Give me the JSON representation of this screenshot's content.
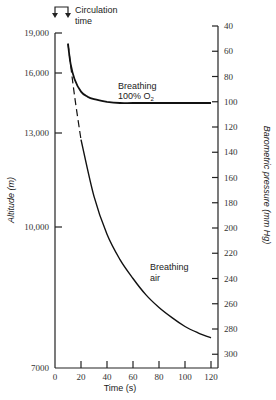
{
  "chart_data": {
    "type": "line",
    "title": "",
    "xlabel": "Time (s)",
    "ylabel_left": "Altitude (m)",
    "ylabel_right": "Barometric pressure (mm Hg)",
    "x_ticks": [
      "0",
      "20",
      "40",
      "60",
      "80",
      "100",
      "120"
    ],
    "xlim": [
      0,
      125
    ],
    "y_left_ticks": [
      "19,000",
      "16,000",
      "13,000",
      "10,000",
      "7000"
    ],
    "y_right_ticks": [
      "40",
      "60",
      "80",
      "100",
      "120",
      "140",
      "160",
      "180",
      "200",
      "220",
      "240",
      "260",
      "280",
      "300"
    ],
    "ylim_right": [
      40,
      310
    ],
    "grid": false,
    "series": [
      {
        "name": "Breathing 100% O2",
        "unit": "mm Hg",
        "x": [
          10,
          12,
          15,
          20,
          25,
          30,
          40,
          50,
          60,
          80,
          100,
          120
        ],
        "values": [
          54,
          70,
          82,
          92,
          96,
          98,
          100,
          101,
          101,
          101,
          101,
          101
        ]
      },
      {
        "name": "Breathing air",
        "unit": "mm Hg",
        "dashed_segment_until_x": 20,
        "x": [
          10,
          15,
          20,
          30,
          40,
          50,
          60,
          70,
          80,
          90,
          100,
          110,
          120
        ],
        "values": [
          54,
          95,
          130,
          175,
          205,
          225,
          240,
          253,
          263,
          271,
          278,
          283,
          287
        ]
      }
    ],
    "annotations": [
      {
        "text": "Circulation time",
        "x_range": [
          0,
          10
        ],
        "position": "top-left"
      },
      {
        "text": "Breathing 100% O2",
        "near_series": 0
      },
      {
        "text": "Breathing air",
        "near_series": 1
      }
    ]
  },
  "labels": {
    "circulation_line1": "Circulation",
    "circulation_line2": "time",
    "o2_line1": "Breathing",
    "o2_line2": "100% O",
    "o2_sub": "2",
    "air_line1": "Breathing",
    "air_line2": "air",
    "xlabel": "Time (s)",
    "ylabel_left": "Altitude (m)",
    "ylabel_right": "Barometric pressure (mm Hg)"
  }
}
